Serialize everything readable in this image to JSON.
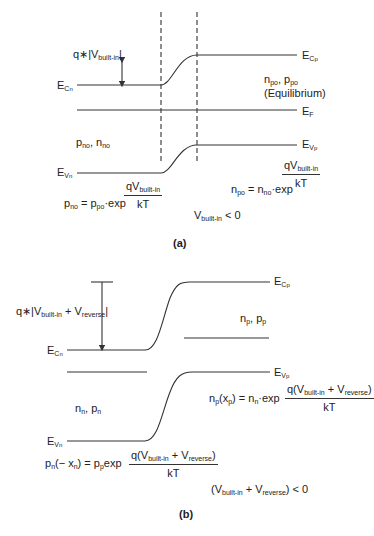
{
  "panel_a": {
    "caption": "(a)",
    "energy_barrier": {
      "prefix": "q∗",
      "V": "V",
      "sub": "built-in"
    },
    "E_Cn": {
      "E": "E",
      "sub": "C",
      "subsub": "n"
    },
    "E_Cp": {
      "E": "E",
      "sub": "C",
      "subsub": "p"
    },
    "E_F": {
      "E": "E",
      "sub": "F"
    },
    "E_Vn": {
      "E": "E",
      "sub": "V",
      "subsub": "n"
    },
    "E_Vp": {
      "E": "E",
      "sub": "V",
      "subsub": "p"
    },
    "p_side_carriers": "n_po, p_po",
    "p_side_carriers_parts": {
      "n": "n",
      "n_sub": "po",
      "sep": ", ",
      "p": "p",
      "p_sub": "po"
    },
    "equilibrium_label": "(Equilibrium)",
    "n_side_carriers_parts": {
      "p": "p",
      "p_sub": "no",
      "sep": ", ",
      "n": "n",
      "n_sub": "no"
    },
    "eq_left": {
      "lhs_p": "p",
      "lhs_sub": "no",
      "eq": " = ",
      "rhs_p": "p",
      "rhs_sub": "po",
      "exp": "·exp",
      "num_q": "qV",
      "num_sub": "built-in",
      "den": "kT"
    },
    "eq_right": {
      "lhs_n": "n",
      "lhs_sub": "po",
      "eq": " = ",
      "rhs_n": "n",
      "rhs_sub": "no",
      "exp": "·exp",
      "num_q": "qV",
      "num_sub": "built-in",
      "den": "kT"
    },
    "condition": {
      "V": "V",
      "sub": "built-in",
      "rel": "< 0"
    }
  },
  "panel_b": {
    "caption": "(b)",
    "energy_barrier": {
      "prefix": "q∗|V",
      "sub1": "built-in",
      "plus": " + V",
      "sub2": "reverse",
      "suffix": "|"
    },
    "E_Cn": {
      "E": "E",
      "sub": "C",
      "subsub": "n"
    },
    "E_Cp": {
      "E": "E",
      "sub": "C",
      "subsub": "p"
    },
    "E_Vn": {
      "E": "E",
      "sub": "V",
      "subsub": "n"
    },
    "E_Vp": {
      "E": "E",
      "sub": "V",
      "subsub": "p"
    },
    "p_side_carriers_parts": {
      "n": "n",
      "n_sub": "p",
      "sep": ", ",
      "p": "p",
      "p_sub": "p"
    },
    "n_side_carriers_parts": {
      "n": "n",
      "n_sub": "n",
      "sep": ", ",
      "p": "p",
      "p_sub": "n"
    },
    "eq_left": {
      "lhs": "p",
      "lhs_sub": "n",
      "arg": "(− x",
      "arg_sub": "n",
      "arg_close": ")",
      "eq": " = p",
      "rhs_sub": "p",
      "exp": "exp",
      "num_open": "q(V",
      "num_sub1": "built-in",
      "num_plus": " + V",
      "num_sub2": "reverse",
      "num_close": ")",
      "den": "kT"
    },
    "eq_right": {
      "lhs": "n",
      "lhs_sub": "p",
      "arg": "(x",
      "arg_sub": "p",
      "arg_close": ")",
      "eq": " = n",
      "rhs_sub": "n",
      "exp": "·exp",
      "num_open": "q(V",
      "num_sub1": "built-in",
      "num_plus": " + V",
      "num_sub2": "reverse",
      "num_close": ")",
      "den": "kT"
    },
    "condition": {
      "open": "(V",
      "sub1": "built-in",
      "plus": " + V",
      "sub2": "reverse",
      "close": ") < 0"
    }
  },
  "colors": {
    "line": "#333333",
    "text": "#222222",
    "background": "#ffffff"
  }
}
